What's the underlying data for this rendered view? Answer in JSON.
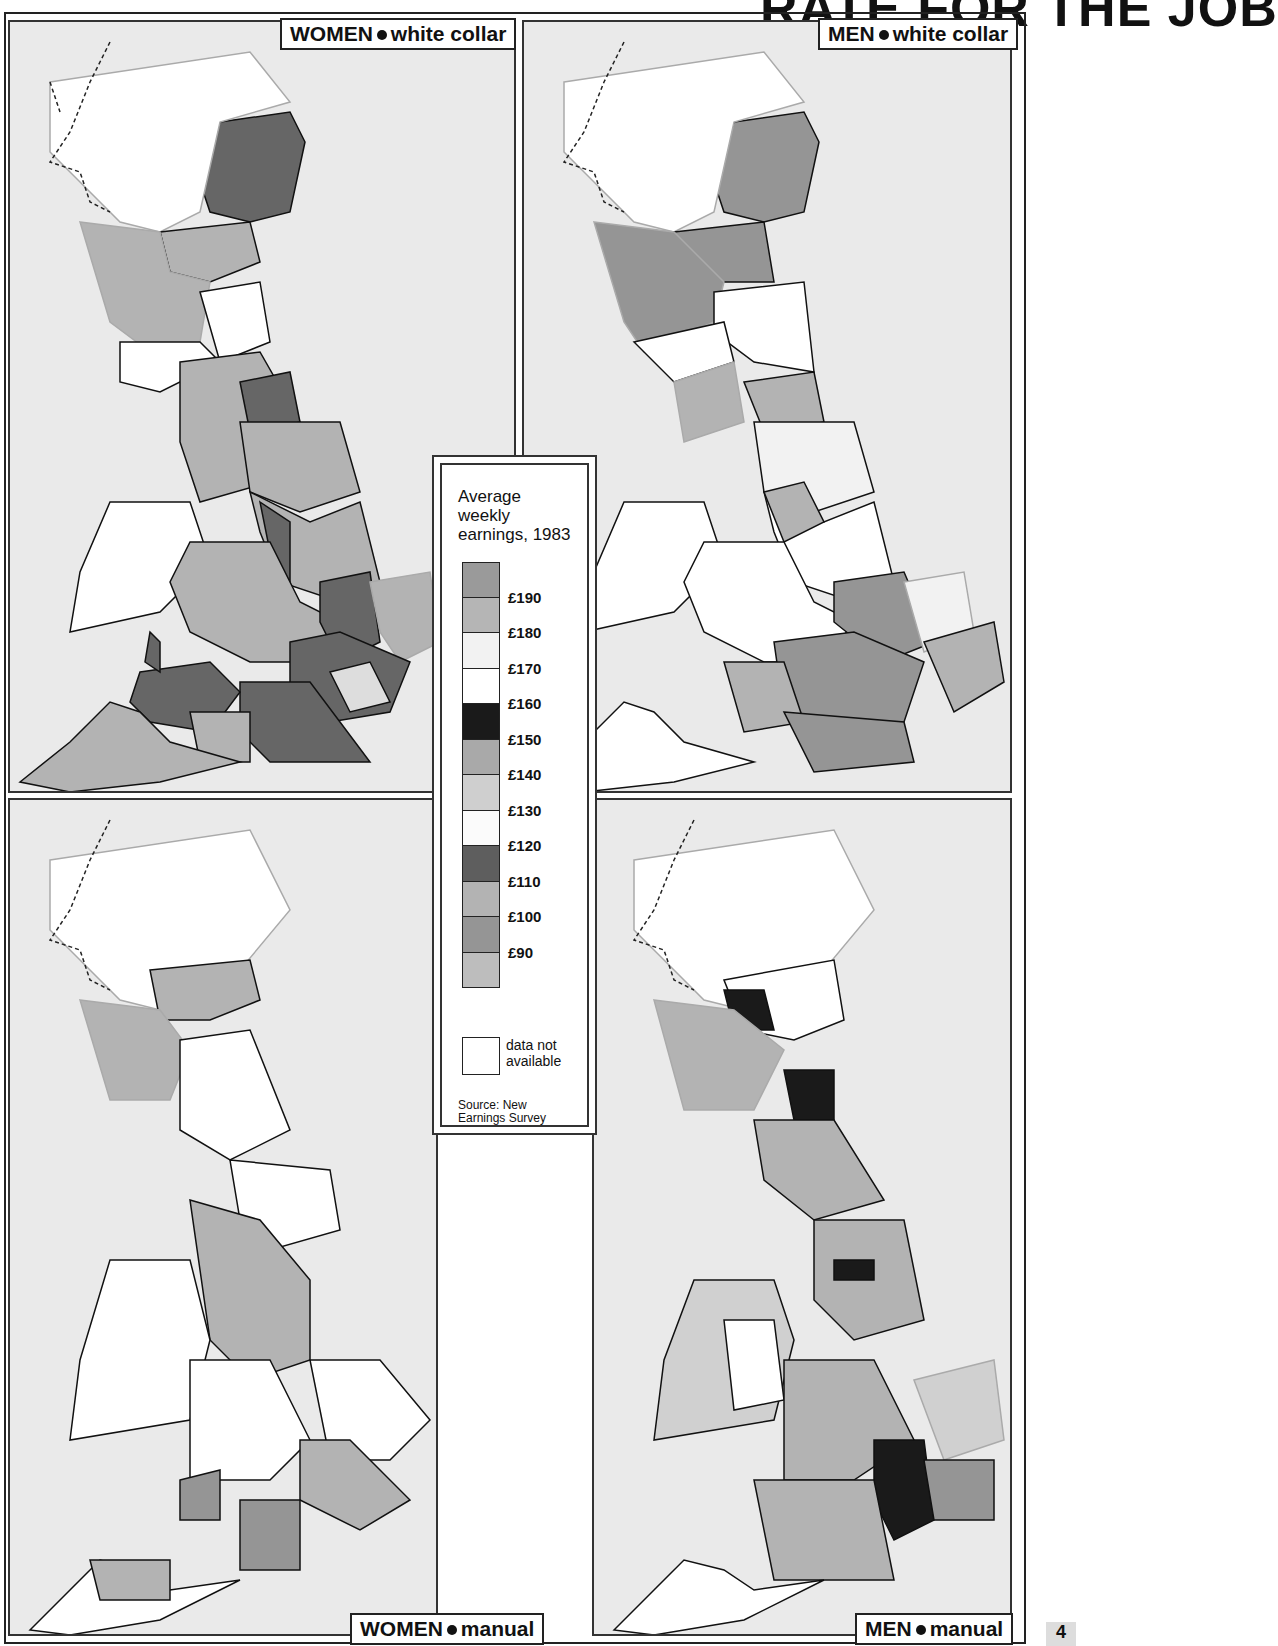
{
  "page": {
    "title": "RATE FOR THE JOB",
    "page_number": "4"
  },
  "panels": [
    {
      "id": "women-white-collar",
      "group": "WOMEN",
      "type": "white collar"
    },
    {
      "id": "men-white-collar",
      "group": "MEN",
      "type": "white collar"
    },
    {
      "id": "women-manual",
      "group": "WOMEN",
      "type": "manual"
    },
    {
      "id": "men-manual",
      "group": "MEN",
      "type": "manual"
    }
  ],
  "legend": {
    "title_line1": "Average",
    "title_line2": "weekly",
    "title_line3": "earnings, 1983",
    "ticks": [
      "£190",
      "£180",
      "£170",
      "£160",
      "£150",
      "£140",
      "£130",
      "£120",
      "£110",
      "£100",
      "£90"
    ],
    "swatch_colors": [
      "#9a9a9a",
      "#b5b5b5",
      "#f2f2f2",
      "#ffffff",
      "#1a1a1a",
      "#a9a9a9",
      "#cfcfcf",
      "#fbfbfb",
      "#5e5e5e",
      "#b3b3b3",
      "#959595",
      "#bdbdbd"
    ],
    "na_label_line1": "data not",
    "na_label_line2": "available",
    "source_line1": "Source: New",
    "source_line2": "Earnings Survey"
  },
  "colors": {
    "background": "#eaeaea",
    "border": "#222222",
    "coast": "#b0b0b0",
    "region_line": "#111111"
  },
  "chart_data": {
    "type": "choropleth",
    "maps": [
      "WOMEN • white collar",
      "MEN • white collar",
      "WOMEN • manual",
      "MEN • manual"
    ],
    "legend_scale": [
      "£190",
      "£180",
      "£170",
      "£160",
      "£150",
      "£140",
      "£130",
      "£120",
      "£110",
      "£100",
      "£90"
    ],
    "no_data_label": "data not available",
    "source": "Source: New Earnings Survey"
  }
}
